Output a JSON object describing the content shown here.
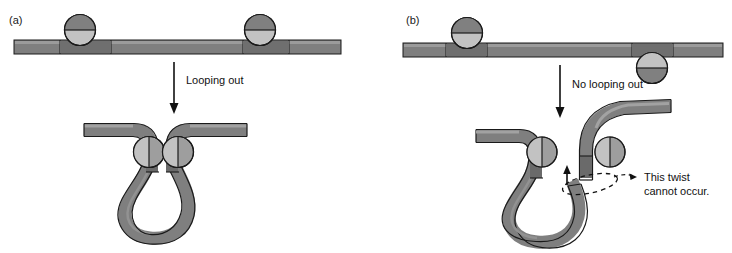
{
  "figure": {
    "panels": [
      {
        "id": "a",
        "label": "(a)",
        "transition_label": "Looping out",
        "description": "Two protein binding sites on the same face of the DNA helix allow looping out"
      },
      {
        "id": "b",
        "label": "(b)",
        "transition_label": "No looping out",
        "annotation_line1": "This twist",
        "annotation_line2": "cannot occur.",
        "description": "Binding sites on opposite faces of the DNA helix prevent looping out"
      }
    ],
    "colors": {
      "dna_fill": "#7f7f7f",
      "dna_highlight": "#a0a0a0",
      "dna_shadow": "#6e6e6e",
      "protein_dark": "#808080",
      "protein_light": "#c2c2c2",
      "outline": "#1a1a1a",
      "background": "#ffffff",
      "text": "#111111"
    }
  }
}
